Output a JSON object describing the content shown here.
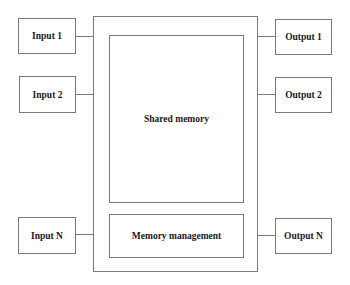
{
  "diagram": {
    "inputs": [
      {
        "label": "Input 1"
      },
      {
        "label": "Input 2"
      },
      {
        "label": "Input N"
      }
    ],
    "outputs": [
      {
        "label": "Output 1"
      },
      {
        "label": "Output 2"
      },
      {
        "label": "Output N"
      }
    ],
    "shared_memory": {
      "label": "Shared memory"
    },
    "memory_management": {
      "label": "Memory management"
    },
    "colors": {
      "stroke": "#7a7a7a",
      "text": "#1a1a1a",
      "background": "#ffffff"
    }
  }
}
